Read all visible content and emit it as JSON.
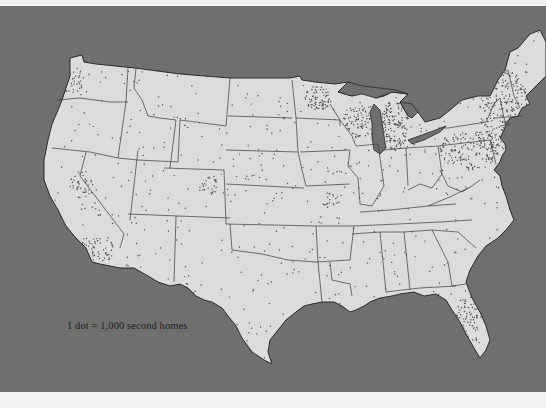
{
  "map": {
    "title": "Second homes in the United States (dot density)",
    "region": "Contiguous United States",
    "legend": {
      "text": "1 dot = 1,000 second homes",
      "dot_value": 1000,
      "unit": "second homes"
    },
    "colors": {
      "water": "#6f6f6d",
      "land": "#dcdcda",
      "borders": "#2a2a2a",
      "dots": "#4a4a4a",
      "page": "#f2f2f0"
    },
    "dense_regions": [
      "Northeast (New England, New York, New Jersey)",
      "Michigan",
      "Wisconsin",
      "Minnesota",
      "Southern California",
      "Northern California (Lake Tahoe area)",
      "Florida",
      "Colorado (Rocky Mountains)",
      "Washington (Puget Sound)"
    ]
  }
}
